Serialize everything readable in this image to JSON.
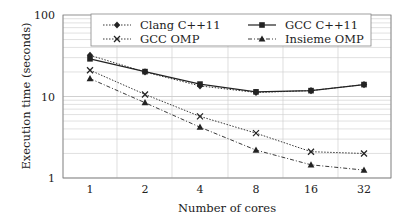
{
  "chart_data": {
    "type": "line",
    "title": "",
    "xlabel": "Number of cores",
    "ylabel": "Execution time (seconds)",
    "x": [
      1,
      2,
      4,
      8,
      16,
      32
    ],
    "x_tick_labels": [
      "1",
      "2",
      "4",
      "8",
      "16",
      "32"
    ],
    "y_scale": "log",
    "ylim": [
      1,
      100
    ],
    "y_tick_labels": [
      "1",
      "10",
      "100"
    ],
    "y_ticks": [
      1,
      10,
      100
    ],
    "grid": true,
    "legend_position": "top-inside",
    "series": [
      {
        "name": "Clang C++11",
        "marker": "diamond",
        "line_style": "dotted",
        "values": [
          32,
          20,
          13.5,
          11.2,
          11.8,
          14.0
        ]
      },
      {
        "name": "GCC C++11",
        "marker": "square",
        "line_style": "solid",
        "values": [
          29,
          20.2,
          14.2,
          11.4,
          11.8,
          14.0
        ]
      },
      {
        "name": "GCC OMP",
        "marker": "x",
        "line_style": "dotted",
        "values": [
          21,
          10.6,
          5.7,
          3.55,
          2.1,
          2.0
        ]
      },
      {
        "name": "Insieme OMP",
        "marker": "triangle",
        "line_style": "dashdot",
        "values": [
          16.6,
          8.4,
          4.2,
          2.2,
          1.45,
          1.25
        ]
      }
    ]
  }
}
